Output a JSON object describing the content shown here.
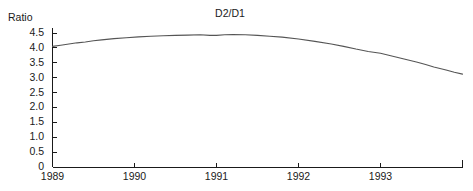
{
  "chart_data": {
    "type": "line",
    "title": "D2/D1",
    "xlabel": "",
    "ylabel": "Ratio",
    "ylim": [
      0,
      4.5
    ],
    "xlim": [
      1989,
      1994
    ],
    "grid": false,
    "legend": "none",
    "y_ticks": [
      "4.5",
      "4.0",
      "3.5",
      "3.0",
      "2.5",
      "2.0",
      "1.5",
      "1.0",
      "0.5",
      "0"
    ],
    "y_tick_values": [
      4.5,
      4.0,
      3.5,
      3.0,
      2.5,
      2.0,
      1.5,
      1.0,
      0.5,
      0
    ],
    "x_ticks": [
      "1989",
      "1990",
      "1991",
      "1992",
      "1993"
    ],
    "x_tick_values": [
      1989,
      1990,
      1991,
      1992,
      1993
    ],
    "line_color": "#555555",
    "axis_color": "#1a1a1a",
    "series": [
      {
        "name": "D2/D1",
        "x": [
          1989.0,
          1989.1,
          1989.2,
          1989.3,
          1989.4,
          1989.5,
          1989.6,
          1989.75,
          1989.9,
          1990.05,
          1990.2,
          1990.35,
          1990.5,
          1990.65,
          1990.8,
          1990.92,
          1991.0,
          1991.1,
          1991.2,
          1991.35,
          1991.5,
          1991.65,
          1991.8,
          1992.0,
          1992.2,
          1992.4,
          1992.55,
          1992.7,
          1992.85,
          1993.0,
          1993.15,
          1993.3,
          1993.45,
          1993.55,
          1993.65,
          1993.8,
          1993.9,
          1994.0
        ],
        "y": [
          4.05,
          4.09,
          4.13,
          4.17,
          4.2,
          4.24,
          4.27,
          4.31,
          4.34,
          4.37,
          4.39,
          4.41,
          4.42,
          4.43,
          4.44,
          4.42,
          4.42,
          4.44,
          4.45,
          4.44,
          4.42,
          4.39,
          4.36,
          4.3,
          4.22,
          4.13,
          4.05,
          3.96,
          3.88,
          3.82,
          3.72,
          3.62,
          3.52,
          3.44,
          3.36,
          3.26,
          3.18,
          3.12
        ]
      }
    ]
  },
  "axis": {
    "y_label": "Ratio",
    "title": "D2/D1"
  }
}
